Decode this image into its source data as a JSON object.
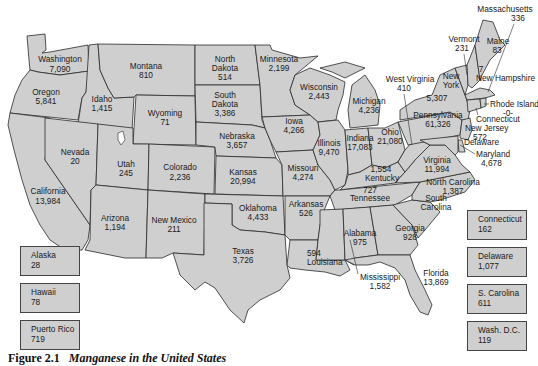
{
  "caption": {
    "label": "Figure 2.1",
    "text": "Manganese in the United States"
  },
  "states": {
    "washington": {
      "name": "Washington",
      "value": "7,090"
    },
    "oregon": {
      "name": "Oregon",
      "value": "5,841"
    },
    "california": {
      "name": "California",
      "value": "13,984"
    },
    "idaho": {
      "name": "Idaho",
      "value": "1,415"
    },
    "nevada": {
      "name": "Nevada",
      "value": "20"
    },
    "montana": {
      "name": "Montana",
      "value": "810"
    },
    "wyoming": {
      "name": "Wyoming",
      "value": "71"
    },
    "utah": {
      "name": "Utah",
      "value": "245"
    },
    "arizona": {
      "name": "Arizona",
      "value": "1,194"
    },
    "colorado": {
      "name": "Colorado",
      "value": "2,236"
    },
    "new_mexico": {
      "name": "New Mexico",
      "value": "211"
    },
    "north_dakota": {
      "name1": "North",
      "name2": "Dakota",
      "value": "514"
    },
    "south_dakota": {
      "name1": "South",
      "name2": "Dakota",
      "value": "3,386"
    },
    "nebraska": {
      "name": "Nebraska",
      "value": "3,657"
    },
    "kansas": {
      "name": "Kansas",
      "value": "20,994"
    },
    "oklahoma": {
      "name": "Oklahoma",
      "value": "4,433"
    },
    "texas": {
      "name": "Texas",
      "value": "3,726"
    },
    "minnesota": {
      "name": "Minnesota",
      "value": "2,199"
    },
    "iowa": {
      "name": "Iowa",
      "value": "4,266"
    },
    "missouri": {
      "name": "Missouri",
      "value": "4,274"
    },
    "arkansas": {
      "name": "Arkansas",
      "value": "526"
    },
    "louisiana": {
      "name": "Louisiana",
      "value": "594"
    },
    "wisconsin": {
      "name": "Wisconsin",
      "value": "2,443"
    },
    "illinois": {
      "name": "Illinois",
      "value": "9,470"
    },
    "michigan": {
      "name": "Michigan",
      "value": "4,236"
    },
    "indiana": {
      "name": "Indiana",
      "value": "17,083"
    },
    "ohio": {
      "name": "Ohio",
      "value": "21,080"
    },
    "kentucky": {
      "name": "Kentucky",
      "value": "1,554"
    },
    "tennessee": {
      "name": "Tennessee",
      "value": "727"
    },
    "mississippi": {
      "name": "Mississippi",
      "value": "1,582"
    },
    "alabama": {
      "name": "Alabama",
      "value": "975"
    },
    "georgia": {
      "name": "Georgia",
      "value": "928"
    },
    "florida": {
      "name": "Florida",
      "value": "13,869"
    },
    "south_carolina": {
      "name1": "South",
      "name2": "Carolina"
    },
    "north_carolina": {
      "name": "North Carolina",
      "value": "1,387"
    },
    "virginia": {
      "name": "Virginia",
      "value": "11,994"
    },
    "west_virginia": {
      "name": "West Virginia",
      "value": "410"
    },
    "pennsylvania": {
      "name": "Pennsylvania",
      "value": "61,326"
    },
    "new_york": {
      "name1": "New",
      "name2": "York",
      "value": "5,307"
    },
    "vermont": {
      "name": "Vermont",
      "value": "231"
    },
    "new_hampshire": {
      "name": "New Hampshire",
      "value": "7"
    },
    "maine": {
      "name": "Maine",
      "value": "83"
    },
    "massachusetts": {
      "name": "Massachusetts",
      "value": "336"
    },
    "rhode_island": {
      "name": "Rhode Island",
      "value": "-0-"
    },
    "connecticut": {
      "name": "Connecticut"
    },
    "new_jersey": {
      "name": "New Jersey",
      "value": "572"
    },
    "delaware": {
      "name": "Delaware"
    },
    "maryland": {
      "name": "Maryland",
      "value": "4,678"
    }
  },
  "insets_left": [
    {
      "name": "Alaska",
      "value": "28"
    },
    {
      "name": "Hawaii",
      "value": "78"
    },
    {
      "name": "Puerto Rico",
      "value": "719"
    }
  ],
  "insets_right": [
    {
      "name": "Connecticut",
      "value": "162"
    },
    {
      "name": "Delaware",
      "value": "1,077"
    },
    {
      "name": "S. Carolina",
      "value": "611"
    },
    {
      "name": "Wash. D.C.",
      "value": "119"
    }
  ],
  "colors": {
    "state_fill": "#cfcfcf",
    "border": "#2a2a2a",
    "background": "#ffffff"
  }
}
